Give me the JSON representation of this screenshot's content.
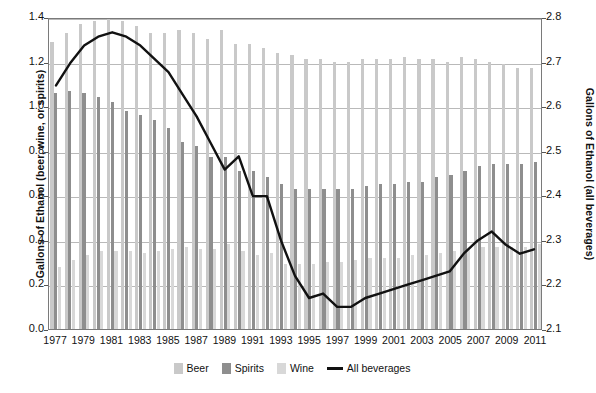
{
  "chart_data": {
    "type": "bar",
    "title": "",
    "subtitle": "",
    "xlabel": "",
    "ylabel": "Gallons of Ethanol (beer, wine, or spirits)",
    "ylabel_right": "Gallons of Ethanol (all beverages)",
    "ylim": [
      0.0,
      1.4
    ],
    "ylim_right": [
      2.1,
      2.8
    ],
    "grid": true,
    "legend_position": "bottom",
    "x": [
      1977,
      1978,
      1979,
      1980,
      1981,
      1982,
      1983,
      1984,
      1985,
      1986,
      1987,
      1988,
      1989,
      1990,
      1991,
      1992,
      1993,
      1994,
      1995,
      1996,
      1997,
      1998,
      1999,
      2000,
      2001,
      2002,
      2003,
      2004,
      2005,
      2006,
      2007,
      2008,
      2009,
      2010,
      2011
    ],
    "categories": [
      "1977",
      "1978",
      "1979",
      "1980",
      "1981",
      "1982",
      "1983",
      "1984",
      "1985",
      "1986",
      "1987",
      "1988",
      "1989",
      "1990",
      "1991",
      "1992",
      "1993",
      "1994",
      "1995",
      "1996",
      "1997",
      "1998",
      "1999",
      "2000",
      "2001",
      "2002",
      "2003",
      "2004",
      "2005",
      "2006",
      "2007",
      "2008",
      "2009",
      "2010",
      "2011"
    ],
    "xtick_labels": [
      "1977",
      "1979",
      "1981",
      "1983",
      "1985",
      "1987",
      "1989",
      "1991",
      "1993",
      "1995",
      "1997",
      "1999",
      "2001",
      "2003",
      "2005",
      "2007",
      "2009",
      "2011"
    ],
    "ytick_labels_left": [
      "0.0",
      "0.2",
      "0.4",
      "0.6",
      "0.8",
      "1.0",
      "1.2",
      "1.4"
    ],
    "ytick_values_left": [
      0.0,
      0.2,
      0.4,
      0.6,
      0.8,
      1.0,
      1.2,
      1.4
    ],
    "ytick_labels_right": [
      "2.1",
      "2.2",
      "2.3",
      "2.4",
      "2.5",
      "2.6",
      "2.7",
      "2.8"
    ],
    "ytick_values_right": [
      2.1,
      2.2,
      2.3,
      2.4,
      2.5,
      2.6,
      2.7,
      2.8
    ],
    "series": [
      {
        "name": "Beer",
        "type": "bar",
        "axis": "left",
        "color": "#c9c9c9",
        "values": [
          1.29,
          1.33,
          1.37,
          1.38,
          1.39,
          1.38,
          1.36,
          1.33,
          1.33,
          1.34,
          1.33,
          1.3,
          1.34,
          1.28,
          1.28,
          1.26,
          1.24,
          1.23,
          1.21,
          1.21,
          1.2,
          1.2,
          1.21,
          1.21,
          1.21,
          1.22,
          1.21,
          1.21,
          1.2,
          1.22,
          1.21,
          1.2,
          1.19,
          1.17,
          1.17
        ]
      },
      {
        "name": "Spirits",
        "type": "bar",
        "axis": "left",
        "color": "#8e8e8e",
        "values": [
          1.06,
          1.07,
          1.06,
          1.04,
          1.02,
          0.98,
          0.96,
          0.94,
          0.9,
          0.84,
          0.82,
          0.77,
          0.77,
          0.71,
          0.71,
          0.68,
          0.65,
          0.63,
          0.63,
          0.63,
          0.63,
          0.63,
          0.64,
          0.65,
          0.65,
          0.66,
          0.66,
          0.68,
          0.69,
          0.71,
          0.73,
          0.74,
          0.74,
          0.74,
          0.75
        ]
      },
      {
        "name": "Wine",
        "type": "bar",
        "axis": "left",
        "color": "#d8d8d8",
        "values": [
          0.28,
          0.31,
          0.33,
          0.35,
          0.35,
          0.35,
          0.34,
          0.35,
          0.36,
          0.37,
          0.36,
          0.36,
          0.38,
          0.35,
          0.33,
          0.34,
          0.29,
          0.29,
          0.29,
          0.3,
          0.3,
          0.31,
          0.32,
          0.32,
          0.32,
          0.33,
          0.33,
          0.34,
          0.35,
          0.36,
          0.37,
          0.37,
          0.37,
          0.37,
          0.38
        ]
      },
      {
        "name": "All beverages",
        "type": "line",
        "axis": "right",
        "color": "#111111",
        "values": [
          2.65,
          2.7,
          2.74,
          2.76,
          2.77,
          2.76,
          2.74,
          2.71,
          2.68,
          2.63,
          2.58,
          2.52,
          2.46,
          2.49,
          2.4,
          2.4,
          2.3,
          2.22,
          2.17,
          2.18,
          2.15,
          2.15,
          2.17,
          2.18,
          2.19,
          2.2,
          2.21,
          2.22,
          2.23,
          2.27,
          2.3,
          2.32,
          2.29,
          2.27,
          2.28
        ]
      }
    ]
  },
  "legend": {
    "items": [
      {
        "label": "Beer",
        "swatch": "beer"
      },
      {
        "label": "Spirits",
        "swatch": "spirits"
      },
      {
        "label": "Wine",
        "swatch": "wine"
      },
      {
        "label": "All beverages",
        "swatch": "line"
      }
    ]
  }
}
